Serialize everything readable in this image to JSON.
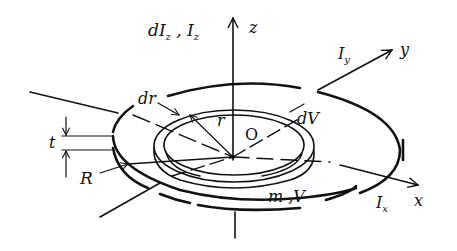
{
  "figure": {
    "colors": {
      "ink": "#111111",
      "background": "#ffffff"
    },
    "labels": {
      "z_axis": "z",
      "y_axis": "y",
      "x_axis": "x",
      "moment_z": {
        "prefix": "d",
        "main": "I",
        "sub": "z",
        "separator": " , ",
        "main2": "I",
        "sub2": "z"
      },
      "moment_y": {
        "main": "I",
        "sub": "y"
      },
      "moment_x": {
        "main": "I",
        "sub": "x"
      },
      "origin": "O",
      "ring_radius": "r",
      "ring_width": "dr",
      "ring_volume": "dV",
      "disk_radius": "R",
      "thickness": "t",
      "mass_volume": "m ,V"
    }
  }
}
